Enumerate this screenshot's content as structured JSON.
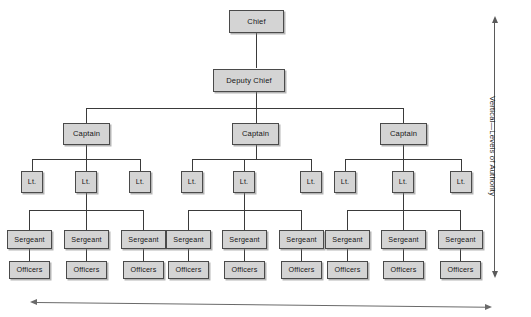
{
  "diagram": {
    "box_fill": "#d4d4d4",
    "box_border": "#4a4a4a",
    "connector_color": "#3a3a3a"
  },
  "axes": {
    "vertical": {
      "label": "Vertical—Levels of Authority",
      "arrow": "double-headed",
      "orientation": "vertical",
      "position": "right"
    },
    "horizontal": {
      "label": "",
      "arrow": "double-headed",
      "orientation": "horizontal",
      "position": "bottom"
    }
  },
  "levels": [
    {
      "name": "chief",
      "label": "Chief"
    },
    {
      "name": "deputy",
      "label": "Deputy Chief"
    },
    {
      "name": "captain",
      "label": "Captain"
    },
    {
      "name": "lt",
      "label": "Lt."
    },
    {
      "name": "sergeant",
      "label": "Sergeant"
    },
    {
      "name": "officers",
      "label": "Officers"
    }
  ],
  "nodes": {
    "chief": "Chief",
    "deputy_chief": "Deputy Chief",
    "captains": [
      "Captain",
      "Captain",
      "Captain"
    ],
    "lieutenants": [
      "Lt.",
      "Lt.",
      "Lt.",
      "Lt.",
      "Lt.",
      "Lt.",
      "Lt.",
      "Lt.",
      "Lt."
    ],
    "sergeants": [
      "Sergeant",
      "Sergeant",
      "Sergeant",
      "Sergeant",
      "Sergeant",
      "Sergeant",
      "Sergeant",
      "Sergeant",
      "Sergeant"
    ],
    "officers": [
      "Officers",
      "Officers",
      "Officers",
      "Officers",
      "Officers",
      "Officers",
      "Officers",
      "Officers",
      "Officers"
    ]
  }
}
